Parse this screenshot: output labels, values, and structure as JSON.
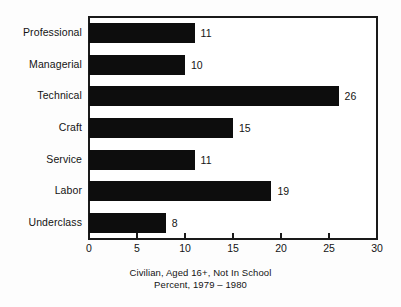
{
  "chart_data": {
    "type": "bar",
    "orientation": "horizontal",
    "title": "",
    "subtitle": "",
    "xlabel": "",
    "ylabel": "",
    "categories": [
      "Professional",
      "Managerial",
      "Technical",
      "Craft",
      "Service",
      "Labor",
      "Underclass"
    ],
    "values": [
      11,
      10,
      26,
      15,
      11,
      19,
      8
    ],
    "value_labels": [
      "11",
      "10",
      "26",
      "15",
      "11",
      "19",
      "8"
    ],
    "xlim": [
      0,
      30
    ],
    "xticks": [
      0,
      5,
      10,
      15,
      20,
      25,
      30
    ],
    "xtick_labels": [
      "0",
      "5",
      "10",
      "15",
      "20",
      "25",
      "30"
    ],
    "grid": false,
    "legend": null,
    "bar_color": "#0d0d0d",
    "frame_color": "#1a1a1a",
    "background_color": "#ffffff"
  },
  "caption": {
    "line1": "Civilian, Aged 16+, Not In School",
    "line2": "Percent, 1979 – 1980"
  }
}
